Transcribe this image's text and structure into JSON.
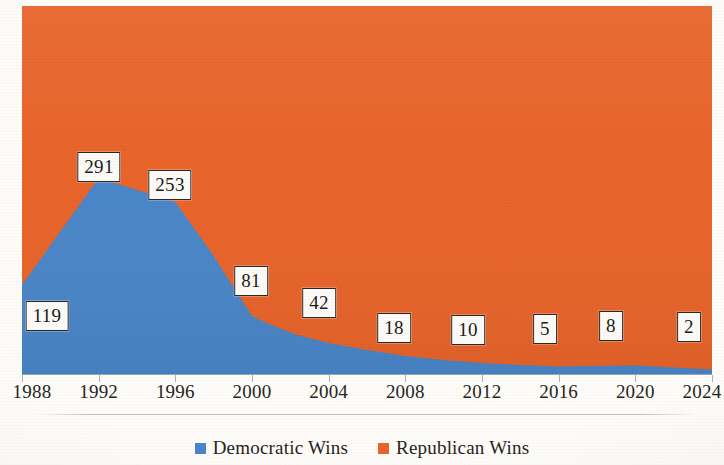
{
  "chart_data": {
    "type": "area",
    "title": "",
    "subtitle": "",
    "xlabel": "",
    "ylabel": "",
    "stacked": true,
    "grid": false,
    "legend_position": "bottom",
    "categories": [
      "1988",
      "1992",
      "1996",
      "2000",
      "2004",
      "2008",
      "2012",
      "2016",
      "2020",
      "2024"
    ],
    "series": [
      {
        "name": "Democratic Wins",
        "color": "#4a86c8",
        "values": [
          119,
          291,
          253,
          81,
          42,
          18,
          10,
          5,
          8,
          2
        ]
      },
      {
        "name": "Republican Wins",
        "color": "#e8642a",
        "values": [
          null,
          null,
          null,
          null,
          null,
          null,
          null,
          null,
          null,
          null
        ]
      }
    ],
    "point_labels": [
      {
        "category": "1988",
        "series": "Democratic Wins",
        "value": "119"
      },
      {
        "category": "1992",
        "series": "Democratic Wins",
        "value": "291"
      },
      {
        "category": "1996",
        "series": "Democratic Wins",
        "value": "253"
      },
      {
        "category": "2000",
        "series": "Democratic Wins",
        "value": "81"
      },
      {
        "category": "2004",
        "series": "Democratic Wins",
        "value": "42"
      },
      {
        "category": "2008",
        "series": "Democratic Wins",
        "value": "18"
      },
      {
        "category": "2012",
        "series": "Democratic Wins",
        "value": "10"
      },
      {
        "category": "2016",
        "series": "Democratic Wins",
        "value": "5"
      },
      {
        "category": "2020",
        "series": "Democratic Wins",
        "value": "8"
      },
      {
        "category": "2024",
        "series": "Democratic Wins",
        "value": "2"
      }
    ]
  },
  "axis": {
    "x_ticks": [
      {
        "label": "1988",
        "x_pct": 0
      },
      {
        "label": "1992",
        "x_pct": 11.1111
      },
      {
        "label": "1996",
        "x_pct": 22.2222
      },
      {
        "label": "2000",
        "x_pct": 33.3333
      },
      {
        "label": "2004",
        "x_pct": 44.4444
      },
      {
        "label": "2008",
        "x_pct": 55.5555
      },
      {
        "label": "2012",
        "x_pct": 66.6666
      },
      {
        "label": "2016",
        "x_pct": 77.7777
      },
      {
        "label": "2020",
        "x_pct": 88.8888
      },
      {
        "label": "2024",
        "x_pct": 100
      }
    ]
  },
  "labels": [
    {
      "text": "119",
      "left": 47,
      "top": 316
    },
    {
      "text": "291",
      "left": 99,
      "top": 167
    },
    {
      "text": "253",
      "left": 170,
      "top": 185
    },
    {
      "text": "81",
      "top": 281,
      "left": 251
    },
    {
      "text": "42",
      "left": 319,
      "top": 303
    },
    {
      "text": "18",
      "left": 394,
      "top": 328
    },
    {
      "text": "10",
      "left": 468,
      "top": 330
    },
    {
      "text": "5",
      "left": 545,
      "top": 329
    },
    {
      "text": "8",
      "left": 611,
      "top": 326
    },
    {
      "text": "2",
      "left": 689,
      "top": 327
    }
  ],
  "legend": {
    "items": [
      {
        "label": "Democratic Wins",
        "color": "#4a86c8",
        "swatch_name": "legend-swatch-democratic"
      },
      {
        "label": "Republican Wins",
        "color": "#e8642a",
        "swatch_name": "legend-swatch-republican"
      }
    ]
  },
  "colors": {
    "democratic": "#4a86c8",
    "republican": "#e8642a",
    "axis": "#9aa4b4",
    "label_border": "#2c2823",
    "label_fill": "#fbfaf7",
    "text": "#272522",
    "page": "#fdfcf9"
  },
  "bleed_through": {
    "lines": [
      "to the general election. McDaniel publicly conc",
      "ated his defeat, and Cochran rode his popularit",
      "anded by liberal families and voter turnout on t",
      "conservative voice in the South in Cong...",
      "... run of 1972 was the first time in 38 ye",
      "ervative candidate from the South would be a",
      "more European ideas, the more conservative t"
    ]
  }
}
